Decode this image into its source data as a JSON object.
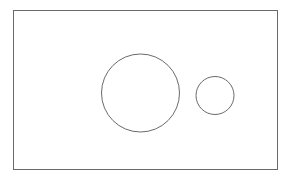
{
  "canvas": {
    "width": 292,
    "height": 175,
    "background": "#ffffff"
  },
  "stroke_color": "#6a6a6a",
  "frame": {
    "x": 13.5,
    "y": 10.5,
    "width": 264,
    "height": 159
  },
  "circles": [
    {
      "name": "large-circle",
      "cx": 140.5,
      "cy": 93,
      "r": 39
    },
    {
      "name": "small-circle",
      "cx": 215,
      "cy": 95.5,
      "r": 19
    }
  ]
}
